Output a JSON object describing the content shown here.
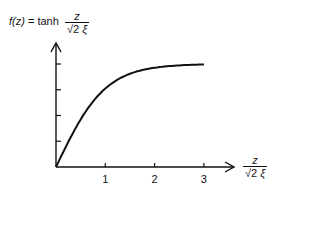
{
  "chart_data": {
    "type": "line",
    "title": "",
    "ylabel": "f(z) = tanh z/(√2 ξ)",
    "ylabel_parts": {
      "lhs": "f(z)",
      "eq": " = tanh",
      "num": "z",
      "den_root": "√2 ",
      "den_xi": "ξ"
    },
    "xlabel": "z/(√2 ξ)",
    "xlabel_parts": {
      "num": "z",
      "den_root": "√2 ",
      "den_xi": "ξ"
    },
    "x_ticks": [
      "1",
      "2",
      "3"
    ],
    "y_ticks_count": 4,
    "y_tick_labels": [],
    "xlim": [
      0,
      3.5
    ],
    "ylim": [
      0,
      1.2
    ],
    "grid": false,
    "legend": null,
    "series": [
      {
        "name": "tanh(z/(√2 ξ))",
        "x": [
          0,
          0.25,
          0.5,
          0.75,
          1.0,
          1.25,
          1.5,
          1.75,
          2.0,
          2.5,
          3.0
        ],
        "values": [
          0,
          0.245,
          0.462,
          0.635,
          0.762,
          0.848,
          0.905,
          0.941,
          0.964,
          0.987,
          0.995
        ]
      }
    ]
  }
}
